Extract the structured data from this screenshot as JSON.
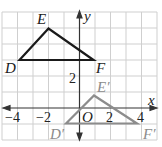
{
  "diagram": {
    "axes": {
      "x_label": "x",
      "y_label": "y",
      "origin_label": "O",
      "x_ticks": [
        {
          "value": -4,
          "label": "−4"
        },
        {
          "value": -2,
          "label": "−2"
        },
        {
          "value": 2,
          "label": "2"
        },
        {
          "value": 4,
          "label": "4"
        }
      ],
      "y_ticks": [
        {
          "value": 2,
          "label": "2"
        }
      ],
      "x_range": [
        -5,
        5
      ],
      "y_range": [
        -2,
        6
      ],
      "grid": true
    },
    "preimage": {
      "name": "DEF",
      "color": "#1a1a1a",
      "vertices": [
        {
          "label": "D",
          "x": -4,
          "y": 3
        },
        {
          "label": "E",
          "x": -2,
          "y": 5
        },
        {
          "label": "F",
          "x": 1,
          "y": 3
        }
      ]
    },
    "image": {
      "name": "D'E'F'",
      "color": "#8c8c8c",
      "vertices": [
        {
          "label": "D′",
          "x": -1,
          "y": -1
        },
        {
          "label": "E′",
          "x": 1,
          "y": 1
        },
        {
          "label": "F′",
          "x": 4,
          "y": -1
        }
      ]
    },
    "colors": {
      "grid": "#cfcfcf",
      "axis": "#333333",
      "label_gray": "#8c8c8c"
    }
  }
}
